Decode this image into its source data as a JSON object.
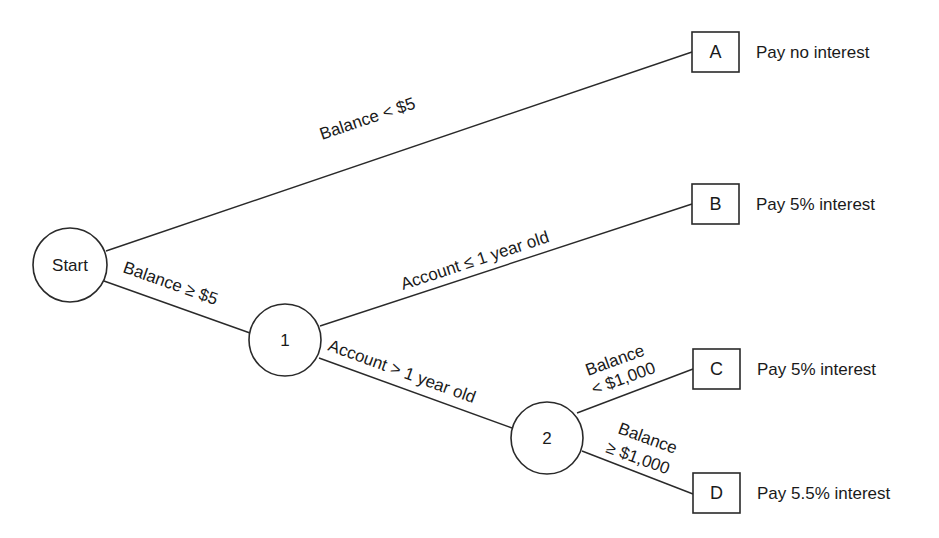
{
  "diagram": {
    "type": "decision-tree",
    "nodes": {
      "start": {
        "label": "Start"
      },
      "n1": {
        "label": "1"
      },
      "n2": {
        "label": "2"
      }
    },
    "leaves": [
      {
        "id": "A",
        "label": "A",
        "outcome": "Pay no interest"
      },
      {
        "id": "B",
        "label": "B",
        "outcome": "Pay 5% interest"
      },
      {
        "id": "C",
        "label": "C",
        "outcome": "Pay 5% interest"
      },
      {
        "id": "D",
        "label": "D",
        "outcome": "Pay 5.5% interest"
      }
    ],
    "edges": [
      {
        "from": "start",
        "to": "A",
        "label": "Balance < $5"
      },
      {
        "from": "start",
        "to": "n1",
        "label": "Balance ≥ $5"
      },
      {
        "from": "n1",
        "to": "B",
        "label": "Account ≤ 1 year old"
      },
      {
        "from": "n1",
        "to": "n2",
        "label": "Account > 1 year old"
      },
      {
        "from": "n2",
        "to": "C",
        "label_line1": "Balance",
        "label_line2": "< $1,000"
      },
      {
        "from": "n2",
        "to": "D",
        "label_line1": "Balance",
        "label_line2": "≥ $1,000"
      }
    ]
  }
}
